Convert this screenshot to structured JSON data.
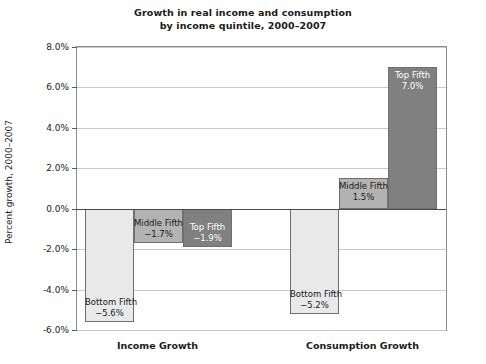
{
  "chart_data": {
    "type": "bar",
    "title": "Growth in real income and consumption by income quintile, 2000–2007",
    "title_lines": [
      "Growth in real income and consumption",
      "by income quintile, 2000–2007"
    ],
    "xlabel": "",
    "ylabel": "Percent growth, 2000–2007",
    "ylim": [
      -6.0,
      8.0
    ],
    "ytick_step": 2.0,
    "ytick_labels": [
      "8.0%",
      "6.0%",
      "4.0%",
      "2.0%",
      "0.0%",
      "-2.0%",
      "-4.0%",
      "-6.0%"
    ],
    "ytick_values": [
      8.0,
      6.0,
      4.0,
      2.0,
      0.0,
      -2.0,
      -4.0,
      -6.0
    ],
    "grid": true,
    "legend": "none",
    "categories": [
      "Income Growth",
      "Consumption Growth"
    ],
    "series": [
      {
        "name": "Bottom Fifth",
        "values": [
          -5.6,
          -5.2
        ],
        "color": "#e9e9e9"
      },
      {
        "name": "Middle Fifth",
        "values": [
          -1.7,
          1.5
        ],
        "color": "#b3b3b3"
      },
      {
        "name": "Top Fifth",
        "values": [
          -1.9,
          7.0
        ],
        "color": "#808080"
      }
    ],
    "bars": [
      {
        "group": "Income Growth",
        "name": "Bottom Fifth",
        "value": -5.6,
        "label": "-5.6%",
        "color": "#e9e9e9",
        "text_on_dark": false
      },
      {
        "group": "Income Growth",
        "name": "Middle Fifth",
        "value": -1.7,
        "label": "-1.7%",
        "color": "#b3b3b3",
        "text_on_dark": false
      },
      {
        "group": "Income Growth",
        "name": "Top Fifth",
        "value": -1.9,
        "label": "-1.9%",
        "color": "#808080",
        "text_on_dark": true
      },
      {
        "group": "Consumption Growth",
        "name": "Bottom Fifth",
        "value": -5.2,
        "label": "-5.2%",
        "color": "#e9e9e9",
        "text_on_dark": false
      },
      {
        "group": "Consumption Growth",
        "name": "Middle Fifth",
        "value": 1.5,
        "label": "1.5%",
        "color": "#b3b3b3",
        "text_on_dark": false
      },
      {
        "group": "Consumption Growth",
        "name": "Top Fifth",
        "value": 7.0,
        "label": "7.0%",
        "color": "#808080",
        "text_on_dark": true
      }
    ],
    "colors": {
      "axis": "#8c8c8c",
      "grid": "#c9c9c9",
      "zero_line": "#4a4a4a",
      "bar_border": "#6f6f6f",
      "text": "#1a1a1a",
      "background": "#ffffff"
    }
  },
  "group_labels": {
    "income": "Income Growth",
    "consumption": "Consumption Growth"
  }
}
